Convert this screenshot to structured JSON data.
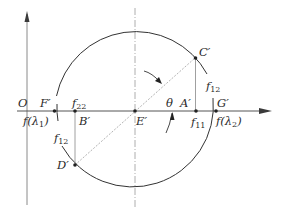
{
  "diagram": {
    "type": "mohr-circle",
    "origin_label": "O",
    "axis_color": "#3a3a3a",
    "circle_color": "#333333",
    "construction_line_color": "#9a9a9a",
    "points": {
      "F": {
        "label": "F′",
        "x": 54,
        "y": 111
      },
      "B": {
        "label": "B′",
        "x": 75,
        "y": 111
      },
      "E": {
        "label": "E′",
        "x": 135,
        "y": 111
      },
      "A": {
        "label": "A′",
        "x": 196,
        "y": 111
      },
      "G": {
        "label": "G′",
        "x": 216,
        "y": 111
      },
      "C": {
        "label": "C′",
        "x": 195,
        "y": 58
      },
      "D": {
        "label": "D′",
        "x": 75,
        "y": 165
      }
    },
    "labels": {
      "f22": {
        "main": "f",
        "sub": "22"
      },
      "f11": {
        "main": "f",
        "sub": "11"
      },
      "f12_top": {
        "main": "f",
        "sub": "12"
      },
      "f12_bottom": {
        "main": "f",
        "sub": "12"
      },
      "f_lambda1": {
        "pre": "f(λ",
        "sub": "1",
        "post": ")"
      },
      "f_lambda2": {
        "pre": "f(λ",
        "sub": "2",
        "post": ")"
      },
      "theta": "θ"
    }
  }
}
